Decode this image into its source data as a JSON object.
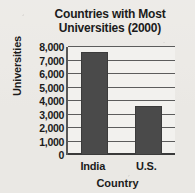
{
  "chart_data": {
    "type": "bar",
    "title": "Countries with Most Universities (2000)",
    "title_lines": [
      "Countries with Most",
      "Universities (2000)"
    ],
    "xlabel": "Country",
    "ylabel": "Universities",
    "categories": [
      "India",
      "U.S."
    ],
    "values": [
      7600,
      3600
    ],
    "ylim": [
      0,
      8000
    ],
    "ytick_values": [
      0,
      1000,
      2000,
      3000,
      4000,
      5000,
      6000,
      7000,
      8000
    ],
    "ytick_labels": [
      "0",
      "1,000",
      "2,000",
      "3,000",
      "4,000",
      "5,000",
      "6,000",
      "7,000",
      "8,000"
    ],
    "grid": true,
    "legend": null,
    "colors": {
      "bar": "#4a4a4a",
      "bar_edge": "#3b3b3b",
      "gridline": "#5c5c5c",
      "axis": "#3a3a3a",
      "plot_background": "#f2f1ee",
      "page_background": "#eceae6",
      "text": "#1b1b1b"
    }
  }
}
